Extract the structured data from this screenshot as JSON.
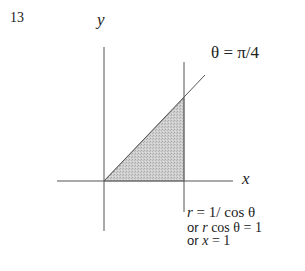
{
  "figure": {
    "number": "13",
    "y_axis_label": "y",
    "x_axis_label": "x",
    "ray_label": "θ = π/4",
    "line_equations": {
      "line1": {
        "lhs": "r",
        "rhs": " = 1/ cos θ"
      },
      "line2": {
        "prefix": "or ",
        "var": "r",
        "rest": " cos θ = 1"
      },
      "line3": {
        "prefix": "or ",
        "var": "x",
        "rest": " = 1"
      }
    },
    "colors": {
      "axis": "#555555",
      "shade": "#c8c8c8",
      "text": "#222222"
    },
    "region": "triangle bounded by x-axis, line θ = π/4, and line x = 1"
  }
}
